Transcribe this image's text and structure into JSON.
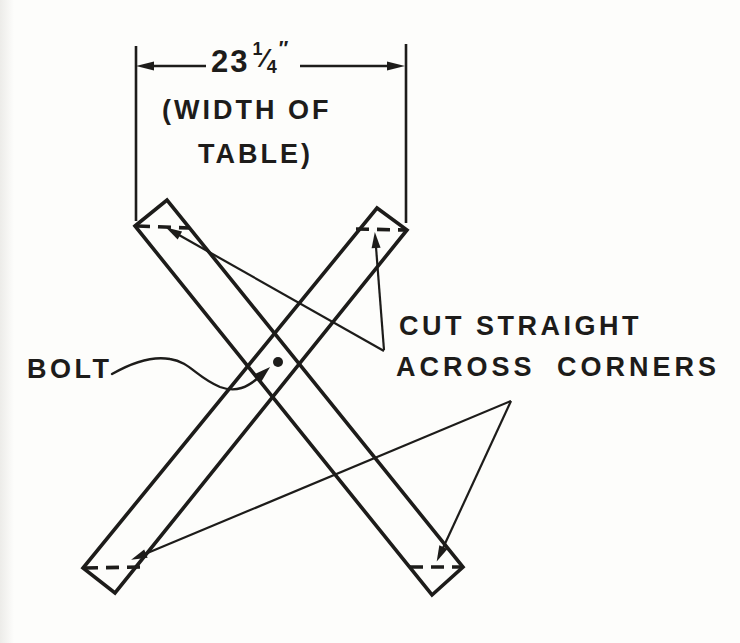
{
  "palette": {
    "ink": "#1d1c1a",
    "paper": "#fdfdfb"
  },
  "dimension": {
    "value_whole": "23",
    "value_numerator": "1",
    "value_denominator": "4",
    "fraction_slash": "⁄",
    "value_unit": "″",
    "note_line1": "(WIDTH OF",
    "note_line2": "TABLE)"
  },
  "labels": {
    "bolt": "BOLT",
    "cut_line1": "CUT STRAIGHT",
    "cut_line2": "ACROSS CORNERS"
  },
  "diagram": {
    "type": "technical-line-drawing",
    "elements": [
      "crossed-leg-board-a",
      "crossed-leg-board-b",
      "center-bolt-dot",
      "corner-cut-dashed-lines",
      "dimension-line-with-extension-lines",
      "leader-arrows-to-cut-corners",
      "wavy-leader-to-bolt"
    ]
  }
}
